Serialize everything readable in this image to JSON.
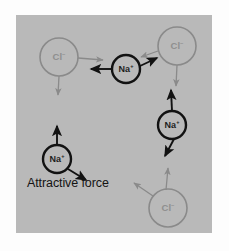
{
  "figure": {
    "type": "ionic-bonding-diagram",
    "panel": {
      "background_color": "#b9b9b9",
      "outer_background_color": "#fdfdfd",
      "x": 16,
      "y": 15,
      "width": 196,
      "height": 218
    },
    "caption": "Attractive force",
    "colors": {
      "sodium_ion_stroke": "#121212",
      "chloride_ion_stroke": "#8a8a8a",
      "attractive_arrow": "#121212",
      "repulsive_arrow": "#8a8a8a",
      "caption_text": "#141414"
    },
    "ions": [
      {
        "id": "cl-top-left",
        "species": "Cl",
        "charge": "–",
        "label": "Cl",
        "label_charge": "–",
        "cx": 59,
        "cy": 57,
        "r": 19,
        "stroke": "#8a8a8a",
        "stroke_width": 1.6,
        "label_color": "#8f8f8f"
      },
      {
        "id": "na-top-middle",
        "species": "Na",
        "charge": "+",
        "label": "Na",
        "label_charge": "+",
        "cx": 126,
        "cy": 69,
        "r": 14,
        "stroke": "#121212",
        "stroke_width": 2.4,
        "label_color": "#1d1d1d"
      },
      {
        "id": "cl-top-right",
        "species": "Cl",
        "charge": "–",
        "label": "Cl",
        "label_charge": "–",
        "cx": 177,
        "cy": 46,
        "r": 19,
        "stroke": "#8a8a8a",
        "stroke_width": 1.6,
        "label_color": "#8f8f8f"
      },
      {
        "id": "na-right",
        "species": "Na",
        "charge": "+",
        "label": "Na",
        "label_charge": "+",
        "cx": 172,
        "cy": 125,
        "r": 14,
        "stroke": "#121212",
        "stroke_width": 2.4,
        "label_color": "#1d1d1d"
      },
      {
        "id": "cl-bottom-right",
        "species": "Cl",
        "charge": "–",
        "label": "Cl",
        "label_charge": "–",
        "cx": 168,
        "cy": 208,
        "r": 19,
        "stroke": "#8a8a8a",
        "stroke_width": 1.6,
        "label_color": "#8f8f8f"
      },
      {
        "id": "na-bottom-left",
        "species": "Na",
        "charge": "+",
        "label": "Na",
        "label_charge": "+",
        "cx": 57,
        "cy": 159,
        "r": 14,
        "stroke": "#121212",
        "stroke_width": 2.4,
        "label_color": "#1d1d1d"
      }
    ],
    "arrows": [
      {
        "id": "arrow-cl-top-left-right",
        "kind": "repulsive",
        "x1": 78,
        "y1": 58,
        "x2": 103,
        "y2": 60,
        "color": "#8a8a8a"
      },
      {
        "id": "arrow-cl-top-left-down",
        "kind": "repulsive",
        "x1": 59,
        "y1": 76,
        "x2": 58,
        "y2": 95,
        "color": "#8a8a8a"
      },
      {
        "id": "arrow-na-top-left",
        "kind": "attractive",
        "x1": 111,
        "y1": 69,
        "x2": 91,
        "y2": 69,
        "color": "#121212"
      },
      {
        "id": "arrow-na-top-upright",
        "kind": "attractive",
        "x1": 140,
        "y1": 66,
        "x2": 157,
        "y2": 58,
        "color": "#121212"
      },
      {
        "id": "arrow-cl-top-right-left",
        "kind": "repulsive",
        "x1": 158,
        "y1": 51,
        "x2": 141,
        "y2": 57,
        "color": "#8a8a8a"
      },
      {
        "id": "arrow-cl-top-right-down",
        "kind": "repulsive",
        "x1": 177,
        "y1": 65,
        "x2": 176,
        "y2": 86,
        "color": "#8a8a8a"
      },
      {
        "id": "arrow-na-right-up",
        "kind": "attractive",
        "x1": 172,
        "y1": 111,
        "x2": 171,
        "y2": 90,
        "color": "#121212"
      },
      {
        "id": "arrow-na-right-downleft",
        "kind": "attractive",
        "x1": 174,
        "y1": 139,
        "x2": 165,
        "y2": 156,
        "color": "#121212"
      },
      {
        "id": "arrow-cl-bottom-up",
        "kind": "repulsive",
        "x1": 166,
        "y1": 190,
        "x2": 168,
        "y2": 168,
        "color": "#8a8a8a"
      },
      {
        "id": "arrow-cl-bottom-upleft",
        "kind": "repulsive",
        "x1": 153,
        "y1": 196,
        "x2": 134,
        "y2": 183,
        "color": "#8a8a8a"
      },
      {
        "id": "arrow-na-bl-up",
        "kind": "attractive",
        "x1": 57,
        "y1": 145,
        "x2": 57,
        "y2": 126,
        "color": "#121212"
      },
      {
        "id": "arrow-na-bl-downright",
        "kind": "attractive",
        "x1": 68,
        "y1": 169,
        "x2": 86,
        "y2": 180,
        "color": "#121212"
      }
    ]
  }
}
